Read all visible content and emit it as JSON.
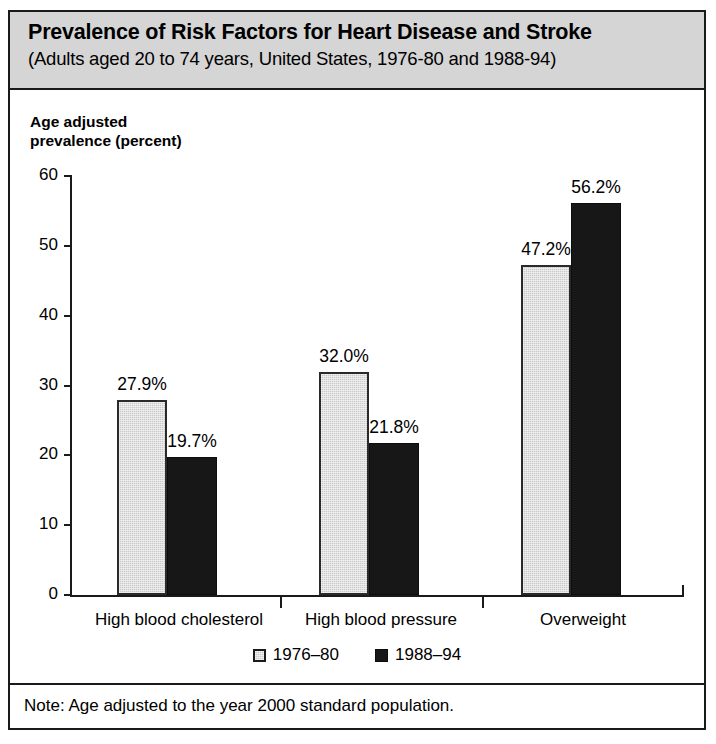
{
  "figure": {
    "title": "Prevalence of Risk Factors for Heart Disease and Stroke",
    "subtitle": "(Adults aged 20 to 74 years, United States, 1976-80 and 1988-94)",
    "note": "Note: Age adjusted to the year 2000 standard population.",
    "colors": {
      "title_band": "#d5d5d5",
      "series_a": "#c9c9c9",
      "series_b": "#171717",
      "frame": "#1a1a1a"
    }
  },
  "chart_data": {
    "type": "bar",
    "title": "Prevalence of Risk Factors for Heart Disease and Stroke",
    "subtitle": "(Adults aged 20 to 74 years, United States, 1976-80 and 1988-94)",
    "xlabel": "",
    "ylabel": "Age adjusted\nprevalence (percent)",
    "ylim": [
      0,
      60
    ],
    "yticks": [
      0,
      10,
      20,
      30,
      40,
      50,
      60
    ],
    "ytick_labels": [
      "0",
      "10",
      "20",
      "30",
      "40",
      "50",
      "60"
    ],
    "grid": false,
    "legend_position": "bottom-center",
    "categories": [
      "High blood cholesterol",
      "High blood pressure",
      "Overweight"
    ],
    "series": [
      {
        "name": "1976–80",
        "color": "#c9c9c9",
        "values": [
          27.9,
          32.0,
          47.2
        ],
        "labels": [
          "27.9%",
          "32.0%",
          "47.2%"
        ]
      },
      {
        "name": "1988–94",
        "color": "#171717",
        "values": [
          19.7,
          21.8,
          56.2
        ],
        "labels": [
          "19.7%",
          "21.8%",
          "56.2%"
        ]
      }
    ],
    "annotations": [
      "Note: Age adjusted to the year 2000 standard population."
    ]
  }
}
